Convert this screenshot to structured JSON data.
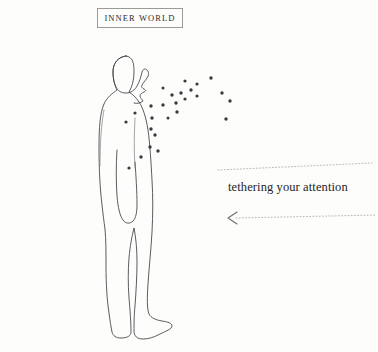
{
  "canvas": {
    "width": 378,
    "height": 352,
    "background_color": "#fdfdfb",
    "ink_color": "#4a4a50",
    "dot_color": "#3a3a40",
    "dotted_color": "#b9b9b5",
    "text_color": "#24242a"
  },
  "label": {
    "text": "INNER WORLD",
    "border_color": "#9a9a96"
  },
  "caption": {
    "text": "tethering your attention"
  },
  "figure": {
    "body_outline": "M 126 56 C 118 57 113 63 113 72 C 113 80 115 86 117 90 C 113 93 107 97 104 104 C 100 113 99 128 99 148 C 99 170 100 188 102 205 C 103 214 104 222 105 229 C 106 240 106 252 106 266 C 106 284 107 300 109 313 C 110 321 111 327 112 332 C 113 336 116 338 121 338 C 127 338 131 336 131 332 C 131 322 130 310 129 298 C 128 284 128 270 129 258 C 130 246 132 236 134 228 C 136 238 137 250 137 262 C 137 276 136 292 135 306 C 134 316 134 325 134 331 C 134 336 137 339 143 339 C 149 339 154 337 158 335 C 166 331 172 329 172 326 C 172 323 168 322 162 321 C 156 320 151 318 149 314 C 147 309 147 298 148 284 C 149 268 151 250 152 232 C 153 214 153 196 152 180 C 151 162 150 144 148 130 C 146 117 143 108 139 102 C 136 97 132 94 129 92 C 132 87 134 80 134 72 C 134 63 133 57 126 56 Z",
    "head_profile": "M 126 56 C 118 57 113 63 113 72 C 113 78 114 83 116 87 C 118 91 121 93 126 93 C 131 93 135 90 137 86 C 140 81 141 76 142 72 C 143 69 145 68 147 70 C 149 72 149 75 147 78 C 145 81 143 83 142 85 C 141 87 142 88 144 89 C 146 90 146 91 144 92 C 142 93 140 94 140 96 C 140 98 142 99 143 101 C 141 103 137 104 134 103",
    "arm": "M 117 150 C 116 165 116 182 117 196 C 118 208 120 216 123 220 C 126 224 130 224 133 221 C 136 218 137 212 137 204 C 137 192 136 176 135 162",
    "chest_line": "M 135 118 C 134 135 134 152 135 168",
    "back_line": "M 104 110 C 101 126 100 146 100 166"
  },
  "dots": {
    "count": 26,
    "points": [
      {
        "x": 152,
        "y": 118,
        "r": 1.7
      },
      {
        "x": 151,
        "y": 129,
        "r": 1.7
      },
      {
        "x": 155,
        "y": 135,
        "r": 1.7
      },
      {
        "x": 150,
        "y": 147,
        "r": 1.7
      },
      {
        "x": 158,
        "y": 151,
        "r": 1.7
      },
      {
        "x": 141,
        "y": 157,
        "r": 1.7
      },
      {
        "x": 129,
        "y": 168,
        "r": 1.6
      },
      {
        "x": 126,
        "y": 122,
        "r": 1.6
      },
      {
        "x": 135,
        "y": 113,
        "r": 1.6
      },
      {
        "x": 151,
        "y": 106,
        "r": 1.7
      },
      {
        "x": 163,
        "y": 105,
        "r": 1.7
      },
      {
        "x": 176,
        "y": 103,
        "r": 1.7
      },
      {
        "x": 172,
        "y": 95,
        "r": 1.7
      },
      {
        "x": 181,
        "y": 93,
        "r": 1.7
      },
      {
        "x": 191,
        "y": 90,
        "r": 1.7
      },
      {
        "x": 197,
        "y": 96,
        "r": 1.6
      },
      {
        "x": 185,
        "y": 99,
        "r": 1.6
      },
      {
        "x": 177,
        "y": 112,
        "r": 1.7
      },
      {
        "x": 197,
        "y": 84,
        "r": 1.6
      },
      {
        "x": 185,
        "y": 81,
        "r": 1.6
      },
      {
        "x": 211,
        "y": 78,
        "r": 1.7
      },
      {
        "x": 222,
        "y": 93,
        "r": 1.7
      },
      {
        "x": 230,
        "y": 101,
        "r": 1.7
      },
      {
        "x": 226,
        "y": 119,
        "r": 1.7
      },
      {
        "x": 163,
        "y": 88,
        "r": 1.5
      },
      {
        "x": 168,
        "y": 118,
        "r": 1.5
      }
    ]
  },
  "dotted_lines": [
    {
      "name": "upper-guide",
      "x1": 218,
      "y1": 170,
      "x2": 372,
      "y2": 163
    },
    {
      "name": "arrow-guide",
      "x1": 236,
      "y1": 218,
      "x2": 376,
      "y2": 215
    }
  ],
  "arrow": {
    "name": "left-arrow",
    "tip_x": 228,
    "tip_y": 218,
    "direction": "left"
  }
}
